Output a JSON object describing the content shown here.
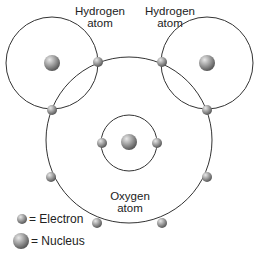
{
  "labels": {
    "hydrogen_left": [
      "Hydrogen",
      "atom"
    ],
    "hydrogen_right": [
      "Hydrogen",
      "atom"
    ],
    "oxygen": [
      "Oxygen",
      "atom"
    ]
  },
  "legend": {
    "electron": "= Electron",
    "nucleus": "= Nucleus"
  },
  "atoms": {
    "hydrogen_count": 2,
    "oxygen_inner_shell_electrons": 2,
    "oxygen_outer_shell_electrons": 6,
    "shared_electron_pairs": 2
  },
  "colors": {
    "orbit": "#333333",
    "particle": "#8c8c8c",
    "text": "#222222"
  }
}
